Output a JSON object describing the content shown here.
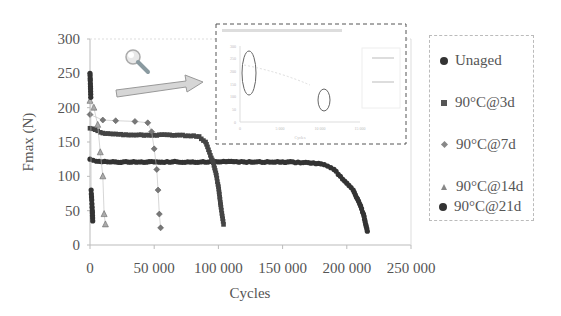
{
  "chart_data": {
    "type": "scatter",
    "title": "",
    "xlabel": "Cycles",
    "ylabel": "Fmax (N)",
    "xlim": [
      0,
      250000
    ],
    "ylim": [
      0,
      300
    ],
    "x_ticks": [
      "0",
      "50 000",
      "100 000",
      "150 000",
      "200 000",
      "250 000"
    ],
    "y_ticks": [
      "0",
      "50",
      "100",
      "150",
      "200",
      "250",
      "300"
    ],
    "grid": false,
    "legend_position": "right",
    "series": [
      {
        "name": "Unaged",
        "marker": "circle",
        "color": "#333333",
        "x": [
          0,
          5000,
          20000,
          50000,
          80000,
          100000,
          120000,
          150000,
          170000,
          180000,
          185000,
          190000,
          195000,
          200000,
          205000,
          210000,
          213000,
          216000
        ],
        "y": [
          125,
          122,
          121,
          121,
          121,
          121,
          121,
          121,
          120,
          118,
          115,
          110,
          100,
          90,
          80,
          60,
          45,
          20
        ]
      },
      {
        "name": "90°C@3d",
        "marker": "square",
        "color": "#444444",
        "x": [
          0,
          10000,
          30000,
          50000,
          70000,
          85000,
          90000,
          93000,
          96000,
          98000,
          100000,
          102000,
          104000
        ],
        "y": [
          170,
          163,
          160,
          160,
          160,
          158,
          150,
          135,
          120,
          105,
          85,
          55,
          30
        ]
      },
      {
        "name": "90°C@7d",
        "marker": "diamond",
        "color": "#555555",
        "x": [
          0,
          10000,
          20000,
          35000,
          45000,
          48000,
          50000,
          52000,
          53000,
          54000,
          55000
        ],
        "y": [
          190,
          182,
          181,
          180,
          178,
          165,
          140,
          110,
          80,
          45,
          25
        ]
      },
      {
        "name": "90°C@14d",
        "marker": "triangle",
        "color": "#666666",
        "x": [
          0,
          3000,
          6000,
          8000,
          10000,
          11000,
          12000
        ],
        "y": [
          210,
          200,
          175,
          135,
          100,
          45,
          30
        ]
      },
      {
        "name": "90°C@21d",
        "marker": "circle",
        "color": "#333333",
        "x": [
          0,
          300,
          600,
          900,
          1200,
          1500,
          1800,
          2100
        ],
        "y": [
          250,
          235,
          215,
          80,
          70,
          60,
          50,
          35
        ]
      }
    ],
    "annotations": [
      "magnifier icon",
      "arrow pointing to inset",
      "inset zoomed plot (dashed frame, illegible text)"
    ]
  },
  "legend": {
    "items": [
      "Unaged",
      "90°C@3d",
      "90°C@7d",
      "90°C@14d",
      "90°C@21d"
    ]
  },
  "axes": {
    "x_title": "Cycles",
    "y_title": "Fmax (N)",
    "x_ticks": [
      "0",
      "50 000",
      "100 000",
      "150 000",
      "200 000",
      "250 000"
    ],
    "y_ticks": [
      "0",
      "50",
      "100",
      "150",
      "200",
      "250",
      "300"
    ]
  },
  "inset": {
    "x_ticks": [
      "0",
      "5 000",
      "10 000",
      "15 000"
    ],
    "x_title": "Cycles",
    "y_ticks": [
      "0",
      "50",
      "100",
      "150",
      "200",
      "250",
      "300"
    ]
  }
}
